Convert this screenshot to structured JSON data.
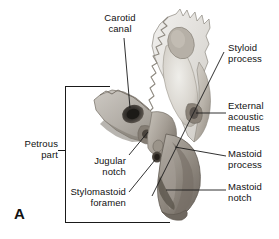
{
  "figure": {
    "panel_letter": "A",
    "background_color": "#ffffff",
    "line_color": "#1a1a1a",
    "text_color": "#111111"
  },
  "labels": {
    "carotid_canal": "Carotid\ncanal",
    "styloid_process": "Styloid\nprocess",
    "external_acoustic_meatus": "External\nacoustic\nmeatus",
    "mastoid_process": "Mastoid\nprocess",
    "mastoid_notch": "Mastoid\nnotch",
    "petrous_part": "Petrous\npart",
    "jugular_notch": "Jugular\nnotch",
    "stylomastoid_foramen": "Stylomastoid\nforamen"
  }
}
